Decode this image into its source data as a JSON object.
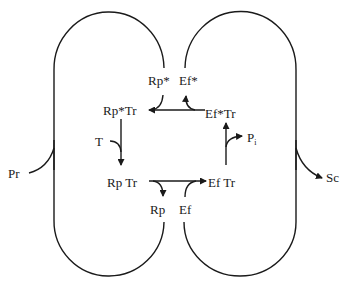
{
  "diagram": {
    "type": "reaction-cycle",
    "stroke_color": "#1a1a1a",
    "background": "#ffffff",
    "labels": {
      "rp_star": "Rp*",
      "ef_star": "Ef*",
      "rp_star_tr": "Rp*Tr",
      "ef_star_tr": "Ef*Tr",
      "t": "T",
      "p": "P",
      "p_sub": "i",
      "rp_tr": "Rp Tr",
      "ef_tr": "Ef Tr",
      "rp": "Rp",
      "ef": "Ef",
      "pr": "Pr",
      "sc": "Sc"
    },
    "edges": [
      {
        "from": "Ef*Tr",
        "to": "Rp*Tr",
        "via": "Rp* in, Ef* out"
      },
      {
        "from": "Rp*Tr",
        "to": "Rp Tr",
        "side_input": "T"
      },
      {
        "from": "Rp Tr",
        "to": "Ef Tr",
        "via": "Rp out, Ef in"
      },
      {
        "from": "Ef Tr",
        "to": "Ef*Tr",
        "side_output": "Pi"
      },
      {
        "loop": "left",
        "input": "Pr",
        "connects": [
          "Rp",
          "Rp*"
        ]
      },
      {
        "loop": "right",
        "output": "Sc",
        "connects": [
          "Ef",
          "Ef*"
        ]
      }
    ]
  }
}
